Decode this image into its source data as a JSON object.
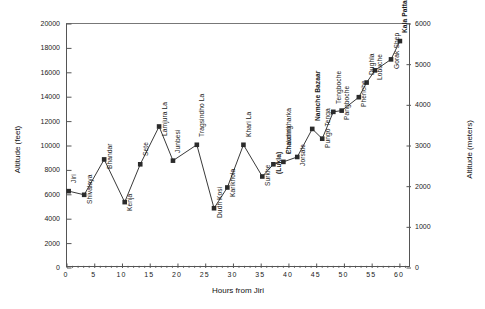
{
  "chart_data": {
    "type": "line",
    "title": "Jiri to Khumbu & Kala Pattar",
    "xlabel": "Hours from Jiri",
    "ylabel": "Altitude (feet)",
    "ylabel_right": "Altitude (meters)",
    "xlim": [
      0,
      62
    ],
    "ylim": [
      0,
      20000
    ],
    "ylim_right": [
      0,
      6000
    ],
    "grid": false,
    "legend": "none",
    "marker": "filled-square",
    "xticks": [
      0,
      5,
      10,
      15,
      20,
      25,
      30,
      35,
      40,
      45,
      50,
      55,
      60
    ],
    "yticks_left": [
      0,
      2000,
      4000,
      6000,
      8000,
      10000,
      12000,
      14000,
      16000,
      18000,
      20000
    ],
    "yticks_right": [
      0,
      1000,
      2000,
      3000,
      4000,
      5000,
      6000
    ],
    "x": [
      0.3,
      3.1,
      6.7,
      10.4,
      13.2,
      16.6,
      19.1,
      23.4,
      26.5,
      28.9,
      31.8,
      35.2,
      37.2,
      39.0,
      41.5,
      44.2,
      46.0,
      48.0,
      49.5,
      52.6,
      54.0,
      55.5,
      58.4,
      60.0
    ],
    "values": [
      6300,
      6000,
      8900,
      5400,
      8500,
      11600,
      8800,
      10100,
      4900,
      6600,
      10100,
      7500,
      8500,
      8700,
      9100,
      11400,
      10600,
      12800,
      12900,
      14000,
      15200,
      16200,
      17100,
      18600
    ],
    "categories": [
      "Jiri",
      "Shivalaya",
      "Bhandar",
      "Kenja",
      "Sete",
      "Lamjura La",
      "Junbesi",
      "Tragsindho La",
      "Dudh Kosi",
      "Karikhola",
      "Khari La",
      "Surkhe",
      "(Lukla)",
      "Phakding",
      "Chaumrikharka",
      "Namche Bazaar",
      "Pungo Tenga",
      "Tengboche",
      "Pangboche",
      "Pheriche",
      "Dughla",
      "Lobuche",
      "Gorak Shep",
      "Kala Pattar"
    ],
    "point_labels": [
      {
        "text": "Jiri",
        "bold": false,
        "anchor": "above"
      },
      {
        "text": "Shivalaya",
        "bold": false,
        "anchor": "below"
      },
      {
        "text": "Bhandar",
        "bold": false,
        "anchor": "below"
      },
      {
        "text": "Kenja",
        "bold": false,
        "anchor": "below"
      },
      {
        "text": "Sete",
        "bold": false,
        "anchor": "above"
      },
      {
        "text": "Lamjura La",
        "bold": false,
        "anchor": "below"
      },
      {
        "text": "Junbesi",
        "bold": false,
        "anchor": "above"
      },
      {
        "text": "Tragsindho La",
        "bold": false,
        "anchor": "above"
      },
      {
        "text": "Dudh Kosi",
        "bold": false,
        "anchor": "below"
      },
      {
        "text": "Karikhola",
        "bold": false,
        "anchor": "below"
      },
      {
        "text": "Khari La",
        "bold": false,
        "anchor": "above"
      },
      {
        "text": "Surkhe",
        "bold": false,
        "anchor": "below"
      },
      {
        "text": "(Lukla)",
        "bold": true,
        "anchor": "below"
      },
      {
        "text": "Phakding",
        "bold": false,
        "anchor": "above"
      },
      {
        "text": "Chaumrikharka",
        "bold": false,
        "anchor": "above"
      },
      {
        "text": "Jorsale",
        "bold": false,
        "anchor": "below"
      },
      {
        "text": "Namche Bazaar",
        "bold": true,
        "anchor": "above"
      },
      {
        "text": "Pungo Tenga",
        "bold": false,
        "anchor": "below"
      },
      {
        "text": "Tengboche",
        "bold": false,
        "anchor": "above"
      },
      {
        "text": "Pangboche",
        "bold": false,
        "anchor": "below"
      },
      {
        "text": "Pheriche",
        "bold": false,
        "anchor": "below"
      },
      {
        "text": "Dughla",
        "bold": false,
        "anchor": "above"
      },
      {
        "text": "Lobuche",
        "bold": false,
        "anchor": "below"
      },
      {
        "text": "Gorak Shep",
        "bold": false,
        "anchor": "below"
      },
      {
        "text": "Kala Pattar",
        "bold": true,
        "anchor": "above"
      }
    ],
    "colors": {
      "line": "#3a3a3a",
      "marker": "#2b2b2b",
      "axis": "#555555",
      "text": "#1a1a1a",
      "background": "#ffffff"
    }
  }
}
